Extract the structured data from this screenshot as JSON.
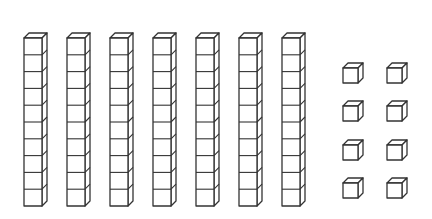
{
  "diagram": {
    "stroke_color": "#333333",
    "fill_color": "#ffffff",
    "rods": {
      "count": 7,
      "cubes_per_rod": 10,
      "x_positions": [
        24,
        67,
        110,
        153,
        196,
        239,
        282
      ],
      "top": 38,
      "unit_height": 16.8,
      "front_width": 18,
      "depth": 5
    },
    "units": {
      "count": 8,
      "columns": 2,
      "rows": 4,
      "x_positions": [
        343,
        387
      ],
      "y_positions": [
        68,
        106,
        145,
        183
      ],
      "size": 15,
      "depth": 5
    },
    "value": {
      "tens": 7,
      "ones": 8,
      "total": 78
    }
  }
}
